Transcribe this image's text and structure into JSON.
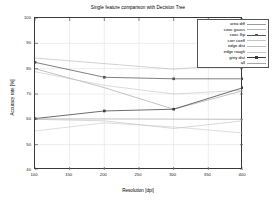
{
  "chart_data": {
    "type": "line",
    "title": "Single feature comparison with Decision Tree",
    "xlabel": "Resolution [dpi]",
    "ylabel": "Accuracy rate [%]",
    "x": [
      100,
      200,
      300,
      400
    ],
    "xlim": [
      100,
      400
    ],
    "ylim": [
      40,
      100
    ],
    "xticks": [
      100,
      150,
      200,
      250,
      300,
      350,
      400
    ],
    "yticks": [
      40,
      50,
      60,
      70,
      80,
      90,
      100
    ],
    "grid": true,
    "legend_position": "top-right-inside",
    "series": [
      {
        "name": "area diff",
        "values": [
          80.0,
          72.5,
          64.0,
          71.3
        ],
        "color": "#9a9a9a",
        "marker": "none"
      },
      {
        "name": "cooc gauss",
        "values": [
          84.2,
          82.0,
          79.8,
          81.8
        ],
        "color": "#b4b4b4",
        "marker": "none"
      },
      {
        "name": "cooc flip",
        "values": [
          82.5,
          76.6,
          76.0,
          76.0
        ],
        "color": "#555555",
        "marker": "square"
      },
      {
        "name": "corr coeff",
        "values": [
          78.8,
          73.4,
          70.0,
          71.5
        ],
        "color": "#c2c2c2",
        "marker": "none"
      },
      {
        "name": "edge dist",
        "values": [
          60.0,
          59.4,
          56.4,
          59.4
        ],
        "color": "#bdbdbd",
        "marker": "none"
      },
      {
        "name": "edge rough",
        "values": [
          55.4,
          58.6,
          57.0,
          54.6
        ],
        "color": "#c8c8c8",
        "marker": "none"
      },
      {
        "name": "grey dist",
        "values": [
          60.3,
          63.3,
          64.0,
          72.5
        ],
        "color": "#3c3c3c",
        "marker": "square"
      },
      {
        "name": "all",
        "values": [
          60.2,
          60.2,
          60.1,
          60.0
        ],
        "color": "#a8a8a8",
        "marker": "none"
      }
    ]
  }
}
